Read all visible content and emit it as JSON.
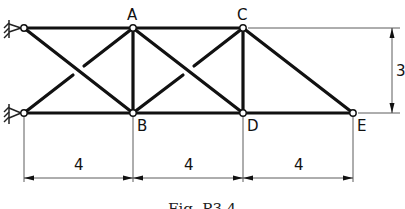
{
  "diagram": {
    "type": "truss",
    "nodes": {
      "A": {
        "label": "A"
      },
      "B": {
        "label": "B"
      },
      "C": {
        "label": "C"
      },
      "D": {
        "label": "D"
      },
      "E": {
        "label": "E"
      }
    },
    "dimensions": {
      "horizontal": [
        "4",
        "4",
        "4"
      ],
      "vertical": "3"
    },
    "supports": [
      "pinned-top-left",
      "pinned-bottom-left"
    ],
    "caption": "Fig. P3.4"
  }
}
